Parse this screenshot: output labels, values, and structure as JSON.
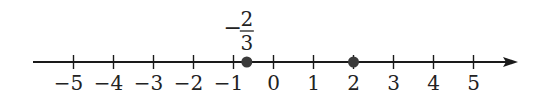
{
  "diagram": {
    "type": "number-line",
    "range": [
      -5,
      5
    ],
    "ticks": [
      {
        "value": -5,
        "label": "−5"
      },
      {
        "value": -4,
        "label": "−4"
      },
      {
        "value": -3,
        "label": "−3"
      },
      {
        "value": -2,
        "label": "−2"
      },
      {
        "value": -1,
        "label": "−1"
      },
      {
        "value": 0,
        "label": "0"
      },
      {
        "value": 1,
        "label": "1"
      },
      {
        "value": 2,
        "label": "2"
      },
      {
        "value": 3,
        "label": "3"
      },
      {
        "value": 4,
        "label": "4"
      },
      {
        "value": 5,
        "label": "5"
      }
    ],
    "points": [
      {
        "value": -0.6667,
        "annotation": {
          "sign": "−",
          "numerator": "2",
          "denominator": "3"
        }
      },
      {
        "value": 2
      }
    ],
    "arrow": "right",
    "colors": {
      "line": "#1a1a1a",
      "point": "#3a3a3a",
      "text": "#222222"
    }
  }
}
